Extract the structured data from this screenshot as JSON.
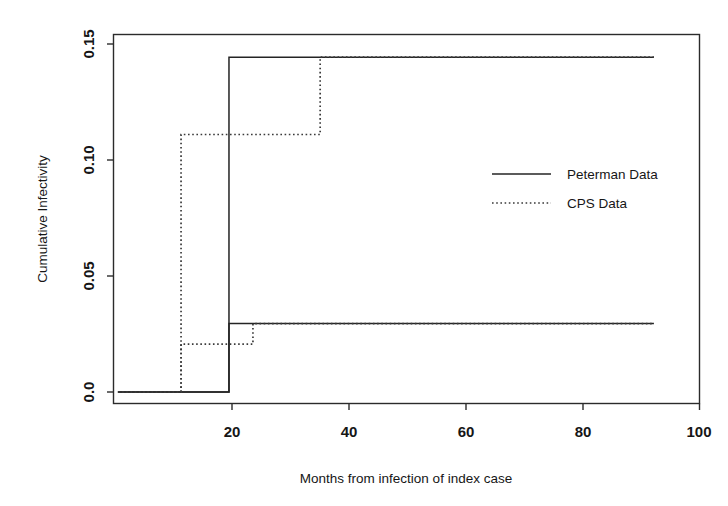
{
  "chart_data": {
    "type": "line",
    "subtype": "step",
    "title": "",
    "xlabel": "Months from infection of index case",
    "ylabel": "Cumulative Infectivity",
    "xlim": [
      -0.5,
      100
    ],
    "ylim": [
      0.0,
      0.1625
    ],
    "grid": false,
    "legend_position": "center-right",
    "x_ticks": [
      20,
      40,
      60,
      80,
      100
    ],
    "x_tick_labels": [
      "20",
      "40",
      "60",
      "80",
      "100"
    ],
    "y_ticks": [
      0.0,
      0.05,
      0.1,
      0.15
    ],
    "y_tick_labels": [
      "0.0",
      "0.05",
      "0.10",
      "0.15"
    ],
    "series": [
      {
        "name": "Peterman Data",
        "style": "solid",
        "color": "#242424",
        "branch": "upper",
        "x": [
          0.5,
          19.5,
          19.5,
          92.2
        ],
        "y": [
          0.0,
          0.0,
          0.1443,
          0.1443
        ]
      },
      {
        "name": "Peterman Data",
        "style": "solid",
        "color": "#242424",
        "branch": "lower",
        "x": [
          0.5,
          19.5,
          19.5,
          92.2
        ],
        "y": [
          0.0,
          0.0,
          0.0295,
          0.0295
        ]
      },
      {
        "name": "CPS Data",
        "style": "dotted",
        "color": "#3a3a3a",
        "branch": "upper",
        "x": [
          0.5,
          11.3,
          11.3,
          35.1,
          35.1,
          92.2
        ],
        "y": [
          0.0,
          0.0,
          0.111,
          0.111,
          0.1443,
          0.1443
        ]
      },
      {
        "name": "CPS Data",
        "style": "dotted",
        "color": "#3a3a3a",
        "branch": "lower",
        "x": [
          0.5,
          11.3,
          11.3,
          23.6,
          23.6,
          92.2
        ],
        "y": [
          0.0,
          0.0,
          0.0206,
          0.0206,
          0.0295,
          0.0295
        ]
      }
    ],
    "legend": [
      {
        "label": "Peterman Data",
        "style": "solid"
      },
      {
        "label": "CPS Data",
        "style": "dotted"
      }
    ],
    "annotations": []
  },
  "axes": {
    "y_title": "Cumulative Infectivity",
    "x_title": "Months from infection of index case",
    "y_tick_labels": [
      "0.0",
      "0.05",
      "0.10",
      "0.15"
    ],
    "x_tick_labels": [
      "20",
      "40",
      "60",
      "80",
      "100"
    ]
  },
  "legend": {
    "entries": [
      {
        "label": "Peterman Data"
      },
      {
        "label": "CPS Data"
      }
    ]
  },
  "colors": {
    "axis": "#2b2b2b",
    "solid_series": "#242424",
    "dotted_series": "#3a3a3a",
    "background": "#ffffff",
    "text": "#161616"
  }
}
